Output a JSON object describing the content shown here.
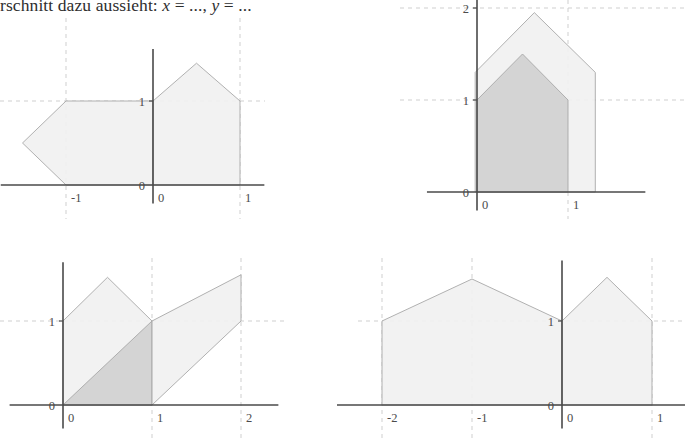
{
  "caption": {
    "text_before": "​rschnitt dazu aussieht: ",
    "var_x": "x",
    "eq1": " = ..., ",
    "var_y": "y",
    "eq2": " = ...",
    "full": "rschnitt dazu aussieht: x = ..., y = ..."
  },
  "colors": {
    "fill_light": "#f1f1f1",
    "fill_dark": "#d2d2d2",
    "stroke": "#a8a8a8",
    "axis": "#4a4a4a",
    "grid": "#c9c9c9",
    "text": "#4b4b4b",
    "background": "#ffffff"
  },
  "chart_data": [
    {
      "id": "figure-1",
      "type": "area",
      "title": "",
      "xlabel": "",
      "ylabel": "",
      "xlim": [
        -1.75,
        1.25
      ],
      "ylim": [
        -0.25,
        1.6
      ],
      "grid": true,
      "x_ticks": [
        {
          "value": -1,
          "label": "-1"
        },
        {
          "value": 0,
          "label": "0"
        },
        {
          "value": 1,
          "label": "1"
        }
      ],
      "y_ticks": [
        {
          "value": 0,
          "label": "0"
        },
        {
          "value": 1,
          "label": "1"
        }
      ],
      "gridlines_x": [
        -1,
        1
      ],
      "gridlines_y": [
        1
      ],
      "shapes": [
        {
          "name": "arrow-pentagon-left",
          "fill": "light",
          "points": [
            [
              -1.5,
              0.5
            ],
            [
              -1,
              1
            ],
            [
              0,
              1
            ],
            [
              0,
              0
            ],
            [
              -1,
              0
            ]
          ]
        },
        {
          "name": "house-right",
          "fill": "light",
          "points": [
            [
              0,
              0
            ],
            [
              0,
              1
            ],
            [
              0.5,
              1.45
            ],
            [
              1,
              1
            ],
            [
              1,
              0
            ]
          ]
        }
      ]
    },
    {
      "id": "figure-2",
      "type": "area",
      "title": "",
      "xlabel": "",
      "ylabel": "",
      "xlim": [
        -0.55,
        1.7
      ],
      "ylim": [
        -0.22,
        2.15
      ],
      "grid": true,
      "x_ticks": [
        {
          "value": 0,
          "label": "0"
        },
        {
          "value": 1,
          "label": "1"
        }
      ],
      "y_ticks": [
        {
          "value": 0,
          "label": "0"
        },
        {
          "value": 1,
          "label": "1"
        },
        {
          "value": 2,
          "label": "2"
        }
      ],
      "gridlines_x": [
        1
      ],
      "gridlines_y": [
        1,
        2
      ],
      "shapes": [
        {
          "name": "outer-house",
          "fill": "light",
          "points": [
            [
              -0.02,
              0
            ],
            [
              -0.02,
              1.3
            ],
            [
              0.63,
              1.95
            ],
            [
              1.3,
              1.3
            ],
            [
              1.3,
              0
            ]
          ]
        },
        {
          "name": "inner-house",
          "fill": "dark",
          "points": [
            [
              0,
              0
            ],
            [
              0,
              1
            ],
            [
              0.5,
              1.5
            ],
            [
              1,
              1
            ],
            [
              1,
              0
            ]
          ]
        }
      ]
    },
    {
      "id": "figure-3",
      "type": "area",
      "title": "",
      "xlabel": "",
      "ylabel": "",
      "xlim": [
        -0.55,
        2.45
      ],
      "ylim": [
        -0.3,
        1.75
      ],
      "grid": true,
      "x_ticks": [
        {
          "value": 0,
          "label": "0"
        },
        {
          "value": 1,
          "label": "1"
        },
        {
          "value": 2,
          "label": "2"
        }
      ],
      "y_ticks": [
        {
          "value": 0,
          "label": "0"
        },
        {
          "value": 1,
          "label": "1"
        }
      ],
      "gridlines_x": [
        1,
        2
      ],
      "gridlines_y": [
        1
      ],
      "shapes": [
        {
          "name": "house-left",
          "fill": "light",
          "points": [
            [
              0,
              0
            ],
            [
              0,
              1
            ],
            [
              0.5,
              1.52
            ],
            [
              1,
              1
            ],
            [
              1,
              0
            ]
          ]
        },
        {
          "name": "triangle-diagonal",
          "fill": "dark",
          "points": [
            [
              0,
              0
            ],
            [
              1,
              1
            ],
            [
              1,
              0
            ]
          ]
        },
        {
          "name": "parallelogram-right",
          "fill": "light",
          "points": [
            [
              1,
              0
            ],
            [
              1,
              1
            ],
            [
              2,
              1.55
            ],
            [
              2,
              1
            ]
          ]
        }
      ]
    },
    {
      "id": "figure-4",
      "type": "area",
      "title": "",
      "xlabel": "",
      "ylabel": "",
      "xlim": [
        -2.5,
        1.45
      ],
      "ylim": [
        -0.3,
        1.75
      ],
      "grid": true,
      "x_ticks": [
        {
          "value": -2,
          "label": "-2"
        },
        {
          "value": -1,
          "label": "-1"
        },
        {
          "value": 0,
          "label": "0"
        },
        {
          "value": 1,
          "label": "1"
        }
      ],
      "y_ticks": [
        {
          "value": 0,
          "label": "0"
        },
        {
          "value": 1,
          "label": "1"
        }
      ],
      "gridlines_x": [
        -2,
        -1,
        1
      ],
      "gridlines_y": [
        1
      ],
      "shapes": [
        {
          "name": "house-wide-left",
          "fill": "light",
          "points": [
            [
              -2,
              0
            ],
            [
              -2,
              1
            ],
            [
              -1,
              1.5
            ],
            [
              0,
              1
            ],
            [
              0,
              0
            ]
          ]
        },
        {
          "name": "house-right",
          "fill": "light",
          "points": [
            [
              0,
              0
            ],
            [
              0,
              1
            ],
            [
              0.5,
              1.52
            ],
            [
              1,
              1
            ],
            [
              1,
              0
            ]
          ]
        }
      ]
    }
  ]
}
